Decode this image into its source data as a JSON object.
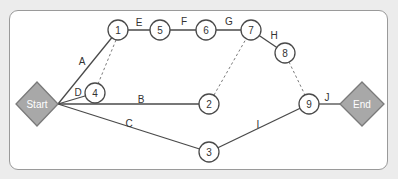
{
  "diagram": {
    "type": "activity-on-arrow network",
    "colors": {
      "background": "#ececec",
      "panel": "#ffffff",
      "line": "#4a4a4a",
      "terminal_fill": "#a8a8a8",
      "terminal_text": "#ffffff"
    },
    "terminals": [
      {
        "id": "start",
        "label": "Start",
        "x": 37,
        "y": 104,
        "rx": 21,
        "ry": 22
      },
      {
        "id": "end",
        "label": "End",
        "x": 362,
        "y": 104,
        "rx": 22,
        "ry": 22
      }
    ],
    "nodes": [
      {
        "id": "n1",
        "label": "1",
        "x": 118,
        "y": 30
      },
      {
        "id": "n2",
        "label": "2",
        "x": 209,
        "y": 104
      },
      {
        "id": "n3",
        "label": "3",
        "x": 209,
        "y": 152
      },
      {
        "id": "n4",
        "label": "4",
        "x": 95,
        "y": 93
      },
      {
        "id": "n5",
        "label": "5",
        "x": 160,
        "y": 30
      },
      {
        "id": "n6",
        "label": "6",
        "x": 206,
        "y": 30
      },
      {
        "id": "n7",
        "label": "7",
        "x": 251,
        "y": 30
      },
      {
        "id": "n8",
        "label": "8",
        "x": 285,
        "y": 53
      },
      {
        "id": "n9",
        "label": "9",
        "x": 309,
        "y": 104
      }
    ],
    "node_radius": 10,
    "activities": [
      {
        "label": "A",
        "from": "start",
        "to": "n1",
        "x1": 58,
        "y1": 104,
        "x2": 118,
        "y2": 30,
        "lx": 82,
        "ly": 61
      },
      {
        "label": "B",
        "from": "start",
        "to": "n2",
        "x1": 58,
        "y1": 104,
        "x2": 209,
        "y2": 104,
        "lx": 141,
        "ly": 99
      },
      {
        "label": "C",
        "from": "start",
        "to": "n3",
        "x1": 58,
        "y1": 104,
        "x2": 209,
        "y2": 152,
        "lx": 129,
        "ly": 123
      },
      {
        "label": "D",
        "from": "start",
        "to": "n4",
        "x1": 58,
        "y1": 104,
        "x2": 95,
        "y2": 93,
        "lx": 78,
        "ly": 92
      },
      {
        "label": "E",
        "from": "n1",
        "to": "n5",
        "x1": 118,
        "y1": 30,
        "x2": 160,
        "y2": 30,
        "lx": 139,
        "ly": 22
      },
      {
        "label": "F",
        "from": "n5",
        "to": "n6",
        "x1": 160,
        "y1": 30,
        "x2": 206,
        "y2": 30,
        "lx": 184,
        "ly": 21
      },
      {
        "label": "G",
        "from": "n6",
        "to": "n7",
        "x1": 206,
        "y1": 30,
        "x2": 251,
        "y2": 30,
        "lx": 229,
        "ly": 21
      },
      {
        "label": "H",
        "from": "n7",
        "to": "n8",
        "x1": 251,
        "y1": 30,
        "x2": 285,
        "y2": 53,
        "lx": 274,
        "ly": 35
      },
      {
        "label": "I",
        "from": "n3",
        "to": "n9",
        "x1": 209,
        "y1": 152,
        "x2": 309,
        "y2": 104,
        "lx": 258,
        "ly": 124
      },
      {
        "label": "J",
        "from": "n9",
        "to": "end",
        "x1": 309,
        "y1": 104,
        "x2": 341,
        "y2": 104,
        "lx": 327,
        "ly": 97
      }
    ],
    "dummies": [
      {
        "from": "n4",
        "to": "n1",
        "x1": 98,
        "y1": 84,
        "x2": 116,
        "y2": 40
      },
      {
        "from": "n2",
        "to": "n7",
        "x1": 214,
        "y1": 95,
        "x2": 246,
        "y2": 39
      },
      {
        "from": "n8",
        "to": "n9",
        "x1": 289,
        "y1": 62,
        "x2": 305,
        "y2": 95
      }
    ]
  }
}
